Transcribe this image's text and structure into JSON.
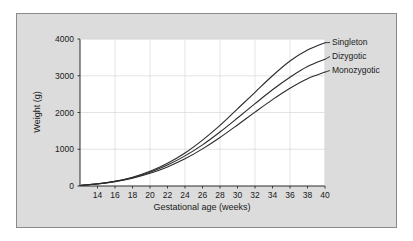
{
  "figure": {
    "background_color": "#dcdcdc",
    "plot_background_color": "#ffffff",
    "border_color": "#8a8a8a",
    "grid_color": "#d8d8dc",
    "curve_color": "#2b2b2b"
  },
  "chart_data": {
    "type": "line",
    "title": "",
    "xlabel": "Gestational age (weeks)",
    "ylabel": "Weight (g)",
    "xlim": [
      12,
      40
    ],
    "ylim": [
      0,
      4000
    ],
    "xticks": [
      14,
      16,
      18,
      20,
      22,
      24,
      26,
      28,
      30,
      32,
      34,
      36,
      38,
      40
    ],
    "yticks": [
      0,
      1000,
      2000,
      3000,
      4000
    ],
    "grid": true,
    "legend_position": "right-inline-labels",
    "x": [
      12,
      14,
      16,
      18,
      20,
      22,
      24,
      26,
      28,
      30,
      32,
      34,
      36,
      38,
      40
    ],
    "series": [
      {
        "name": "Singleton",
        "values": [
          15,
          60,
          130,
          240,
          400,
          620,
          900,
          1250,
          1650,
          2100,
          2550,
          3000,
          3400,
          3700,
          3900
        ]
      },
      {
        "name": "Dizygotic",
        "values": [
          15,
          58,
          125,
          225,
          375,
          570,
          820,
          1120,
          1470,
          1850,
          2240,
          2620,
          2960,
          3250,
          3450
        ]
      },
      {
        "name": "Monozygotic",
        "values": [
          15,
          55,
          118,
          210,
          345,
          520,
          740,
          1010,
          1320,
          1660,
          2010,
          2350,
          2660,
          2920,
          3100
        ]
      }
    ]
  },
  "axis": {
    "xtick_labels": [
      "14",
      "16",
      "18",
      "20",
      "22",
      "24",
      "26",
      "28",
      "30",
      "32",
      "34",
      "36",
      "38",
      "40"
    ],
    "ytick_labels": [
      "0",
      "1000",
      "2000",
      "3000",
      "4000"
    ],
    "xlabel": "Gestational age (weeks)",
    "ylabel": "Weight (g)"
  },
  "legend": {
    "items": [
      {
        "label": "Singleton"
      },
      {
        "label": "Dizygotic"
      },
      {
        "label": "Monozygotic"
      }
    ]
  }
}
